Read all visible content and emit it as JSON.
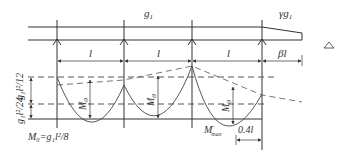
{
  "diagram": {
    "type": "continuous-beam-moment-diagram",
    "loads": {
      "span_load": "g",
      "span_load_sub": "1",
      "cantilever_load": "γg",
      "cantilever_load_sub": "1"
    },
    "spans": {
      "interior_label": "l",
      "cantilever_label": "βl"
    },
    "moments": {
      "span_moment": "M",
      "span_moment_sub": "0",
      "max_negative": "M",
      "max_negative_sub": "max",
      "max_negative_sup": "-",
      "footnote": "M₀=g₁l²/8"
    },
    "side_dimensions": {
      "upper": "g₁l²/12",
      "lower": "g₁l²/24"
    },
    "offset_label": "0.4l",
    "supports_count": 4,
    "colors": {
      "line": "#333333",
      "dashed": "#555555",
      "background": "#ffffff"
    }
  }
}
